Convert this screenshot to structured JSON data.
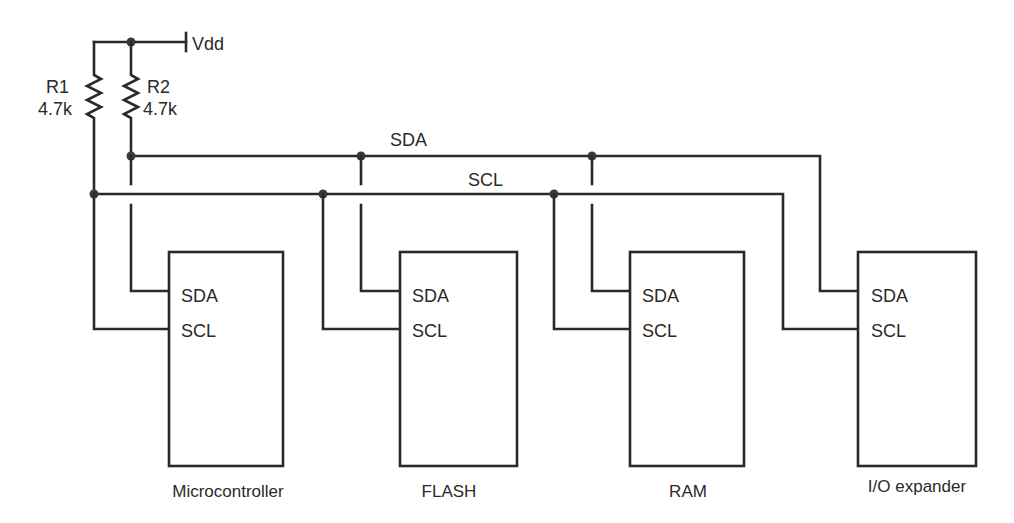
{
  "power": {
    "label": "Vdd"
  },
  "resistors": [
    {
      "name": "R1",
      "value": "4.7k"
    },
    {
      "name": "R2",
      "value": "4.7k"
    }
  ],
  "buses": {
    "sda": "SDA",
    "scl": "SCL"
  },
  "devices": [
    {
      "name": "Microcontroller",
      "pin_sda": "SDA",
      "pin_scl": "SCL"
    },
    {
      "name": "FLASH",
      "pin_sda": "SDA",
      "pin_scl": "SCL"
    },
    {
      "name": "RAM",
      "pin_sda": "SDA",
      "pin_scl": "SCL"
    },
    {
      "name": "I/O expander",
      "pin_sda": "SDA",
      "pin_scl": "SCL"
    }
  ],
  "colors": {
    "line": "#2a2a2a",
    "background": "#ffffff"
  }
}
